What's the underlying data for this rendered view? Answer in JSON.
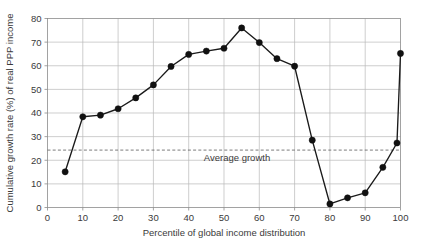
{
  "chart_data": {
    "type": "line",
    "title": "",
    "xlabel": "Percentile of global income distribution",
    "ylabel": "Cumulative growth rate (%) of real PPP income",
    "xlim": [
      0,
      100
    ],
    "ylim": [
      0,
      80
    ],
    "xticks": [
      0,
      10,
      20,
      30,
      40,
      50,
      60,
      70,
      80,
      90,
      100
    ],
    "yticks": [
      0,
      10,
      20,
      30,
      40,
      50,
      60,
      70,
      80
    ],
    "grid": true,
    "legend": "none",
    "series": [
      {
        "name": "Cumulative growth rate",
        "x": [
          5,
          10,
          15,
          20,
          25,
          30,
          35,
          40,
          45,
          50,
          55,
          60,
          65,
          70,
          75,
          80,
          85,
          90,
          95,
          99,
          100
        ],
        "values": [
          15.1,
          38.4,
          39.1,
          41.8,
          46.4,
          51.9,
          59.7,
          64.8,
          66.2,
          67.4,
          76.0,
          69.8,
          63.0,
          59.8,
          28.5,
          1.5,
          4.1,
          6.2,
          17.0,
          27.3,
          65.2
        ],
        "marker": "circle",
        "color": "#111111"
      }
    ],
    "annotations": [
      {
        "name": "average-growth",
        "label": "Average growth",
        "type": "hline",
        "value": 24.3,
        "style": "dashed"
      }
    ],
    "colors": {
      "line": "#111111",
      "marker": "#111111",
      "grid": "#b9b9b9",
      "frame": "#8c8c8c",
      "average": "#5a5a5a",
      "text": "#3a3a3a",
      "background": "#ffffff"
    }
  }
}
